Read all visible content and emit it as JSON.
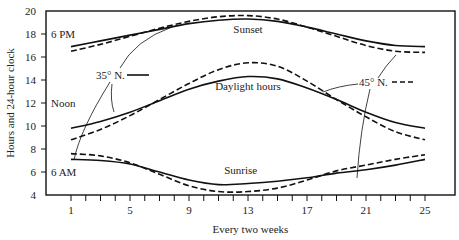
{
  "chart_data": {
    "type": "line",
    "title": "",
    "xlabel": "Every two weeks",
    "ylabel": "Hours and 24-hour clock",
    "xlim": [
      1,
      25
    ],
    "ylim": [
      4,
      20
    ],
    "x_ticks": [
      1,
      5,
      9,
      13,
      17,
      21,
      25
    ],
    "y_ticks": [
      4,
      6,
      8,
      10,
      12,
      14,
      16,
      18,
      20
    ],
    "y_tick_annotations": {
      "18": "6 PM",
      "12": "Noon",
      "6": "6 AM"
    },
    "grid": false,
    "legend": [
      {
        "label": "35° N.",
        "style": "solid"
      },
      {
        "label": "45° N.",
        "style": "dashed"
      }
    ],
    "annotations": [
      "Sunset",
      "Daylight hours",
      "Sunrise"
    ],
    "x": [
      1,
      3,
      5,
      7,
      9,
      11,
      13,
      15,
      17,
      19,
      21,
      23,
      25
    ],
    "series": [
      {
        "name": "Sunset 35° N.",
        "style": "solid",
        "values": [
          16.9,
          17.4,
          17.9,
          18.4,
          18.9,
          19.2,
          19.3,
          19.1,
          18.6,
          18.0,
          17.4,
          17.0,
          16.9
        ]
      },
      {
        "name": "Sunset 45° N.",
        "style": "dashed",
        "values": [
          16.5,
          17.1,
          17.8,
          18.5,
          19.1,
          19.5,
          19.6,
          19.3,
          18.6,
          17.8,
          17.0,
          16.5,
          16.4
        ]
      },
      {
        "name": "Daylight hours 35° N.",
        "style": "solid",
        "values": [
          9.8,
          10.4,
          11.2,
          12.2,
          13.2,
          13.9,
          14.3,
          14.1,
          13.3,
          12.3,
          11.2,
          10.3,
          9.8
        ]
      },
      {
        "name": "Daylight hours 45° N.",
        "style": "dashed",
        "values": [
          8.8,
          9.7,
          10.9,
          12.3,
          13.7,
          14.9,
          15.5,
          15.2,
          13.9,
          12.3,
          10.8,
          9.5,
          8.8
        ]
      },
      {
        "name": "Sunrise 35° N.",
        "style": "solid",
        "values": [
          7.1,
          7.0,
          6.7,
          6.0,
          5.3,
          4.9,
          5.0,
          5.2,
          5.5,
          5.9,
          6.2,
          6.6,
          7.1
        ]
      },
      {
        "name": "Sunrise 45° N.",
        "style": "dashed",
        "values": [
          7.6,
          7.4,
          6.8,
          5.8,
          4.8,
          4.3,
          4.3,
          4.6,
          5.3,
          6.1,
          6.6,
          7.1,
          7.5
        ]
      }
    ]
  }
}
